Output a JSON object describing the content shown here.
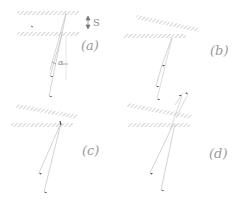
{
  "panels": [
    {
      "id": "a",
      "label": "(a)"
    },
    {
      "id": "b",
      "label": "(b)"
    },
    {
      "id": "c",
      "label": "(c)"
    },
    {
      "id": "d",
      "label": "(d)"
    }
  ],
  "annotations": {
    "separation": "S",
    "angle": "α"
  },
  "colors": {
    "hatch": "#a8a8a8",
    "ray": "#b5b5b5",
    "arrowhead": "#555555",
    "label": "#9a9a9a"
  }
}
